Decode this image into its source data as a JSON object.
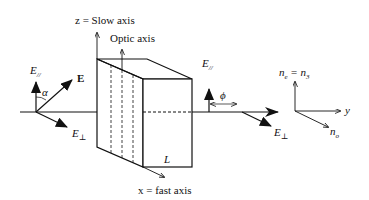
{
  "diagram": {
    "type": "optics-waveplate",
    "labels": {
      "slow_axis": "z = Slow axis",
      "optic_axis": "Optic axis",
      "fast_axis": "x = fast  axis",
      "thickness": "L",
      "input_E_parallel": "E",
      "input_E_parallel_sub": "//",
      "input_E": "E",
      "input_alpha": "α",
      "input_E_perp": "E",
      "input_E_perp_sub": "⊥",
      "output_E_parallel": "E",
      "output_E_parallel_sub": "//",
      "output_phi": "ϕ",
      "output_E_perp": "E",
      "output_E_perp_sub": "⊥",
      "axes_ne": "n",
      "axes_ne_sub": "e",
      "axes_ne_eq": " = n",
      "axes_ne_eq_sub": "3",
      "axes_y": "y",
      "axes_no": "n",
      "axes_no_sub": "o"
    },
    "colors": {
      "line": "#111111",
      "background": "#ffffff"
    }
  }
}
